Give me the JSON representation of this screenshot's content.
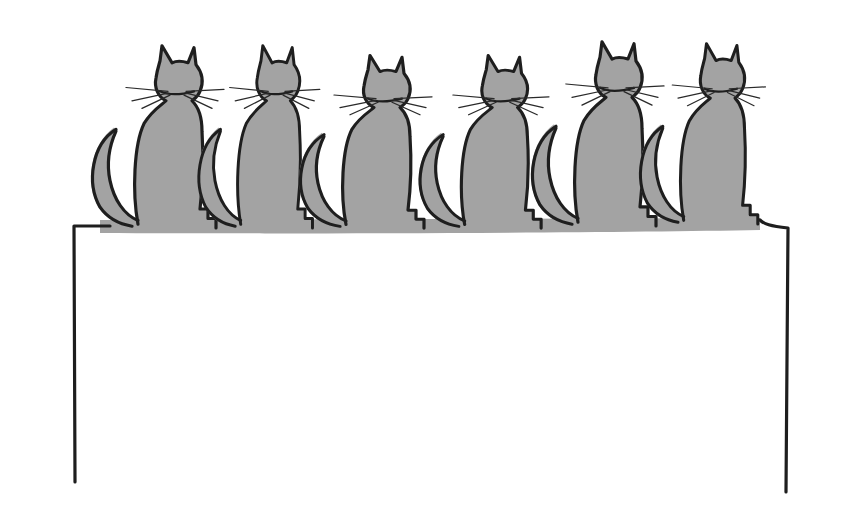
{
  "illustration": {
    "subject": "six cats sitting in a row on a table, seen from behind",
    "style": "hand-drawn ink line with grey fill",
    "colors": {
      "background": "#ffffff",
      "fill": "#a3a3a3",
      "ink": "#1e1e1e"
    },
    "cats": [
      {
        "id": 1,
        "x": 178,
        "head_top": 48
      },
      {
        "id": 2,
        "x": 280,
        "head_top": 48
      },
      {
        "id": 3,
        "x": 388,
        "head_top": 55
      },
      {
        "id": 4,
        "x": 505,
        "head_top": 55
      },
      {
        "id": 5,
        "x": 617,
        "head_top": 46
      },
      {
        "id": 6,
        "x": 723,
        "head_top": 48
      }
    ],
    "table": {
      "top_y": 228,
      "left_leg_x": 75,
      "left_leg_bottom": 482,
      "right_leg_x": 787,
      "right_leg_bottom": 492
    }
  }
}
